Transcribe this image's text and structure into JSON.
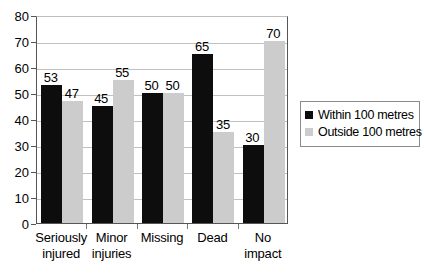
{
  "chart_data": {
    "type": "bar",
    "title": "",
    "xlabel": "",
    "ylabel": "",
    "ylim": [
      0,
      80
    ],
    "ytick_step": 10,
    "yticks": [
      0,
      10,
      20,
      30,
      40,
      50,
      60,
      70,
      80
    ],
    "grid": true,
    "legend_position": "right",
    "categories": [
      "Seriously injured",
      "Minor injuries",
      "Missing",
      "Dead",
      "No impact"
    ],
    "category_lines": [
      [
        "Seriously",
        "injured"
      ],
      [
        "Minor",
        "injuries"
      ],
      [
        "Missing",
        ""
      ],
      [
        "Dead",
        ""
      ],
      [
        "No",
        "impact"
      ]
    ],
    "series": [
      {
        "name": "Within 100 metres",
        "color": "#0d0d0d",
        "values": [
          53,
          45,
          50,
          65,
          30
        ]
      },
      {
        "name": "Outside 100 metres",
        "color": "#cccccc",
        "values": [
          47,
          55,
          50,
          35,
          70
        ]
      }
    ]
  },
  "legend": {
    "items": [
      {
        "label": "Within 100 metres",
        "swatch_name": "legend-swatch-within"
      },
      {
        "label": "Outside 100 metres",
        "swatch_name": "legend-swatch-outside"
      }
    ]
  },
  "colors": {
    "series_within": "#0d0d0d",
    "series_outside": "#cccccc",
    "gridline": "#c0c0c0",
    "axis": "#555555",
    "background": "#ffffff"
  }
}
